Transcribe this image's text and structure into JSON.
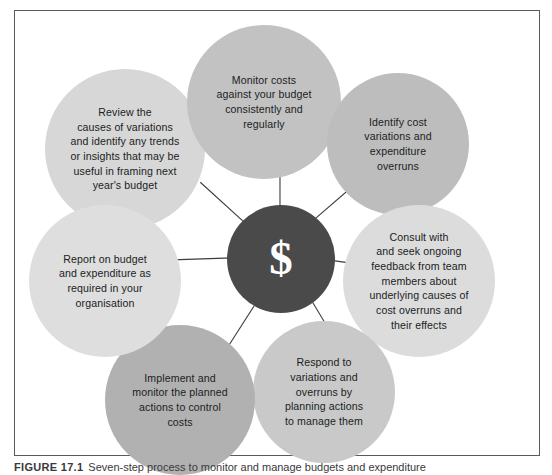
{
  "figure": {
    "caption_tag": "FIGURE 17.1",
    "caption_text": "Seven-step process to monitor and manage budgets and expenditure",
    "hub": {
      "symbol": "$",
      "name": "budget-and-expenditure-control",
      "fill": "#4a4a4a",
      "text_color": "#ffffff"
    },
    "frame": {
      "border_color": "#5a5a5a",
      "background": "#ffffff"
    },
    "connector_color": "#3c3c3c",
    "nodes": [
      {
        "id": "monitor-costs",
        "label": "Monitor costs\nagainst your budget\nconsistently and\nregularly",
        "fill": "#c2c2c2",
        "position": "top"
      },
      {
        "id": "identify-cost-variations",
        "label": "Identify cost\nvariations and\nexpenditure\noverruns",
        "fill": "#bdbdbd",
        "position": "upper-right"
      },
      {
        "id": "consult-and-seek-feedback",
        "label": "Consult with\nand seek ongoing\nfeedback from team\nmembers about\nunderlying causes of\ncost overruns and\ntheir effects",
        "fill": "#dcdcdc",
        "position": "lower-right"
      },
      {
        "id": "respond-to-variations",
        "label": "Respond to\nvariations and\noverruns by\nplanning actions\nto manage them",
        "fill": "#c9c9c9",
        "position": "bottom-right"
      },
      {
        "id": "implement-and-monitor-actions",
        "label": "Implement and\nmonitor the planned\nactions to control\ncosts",
        "fill": "#b1b1b1",
        "position": "bottom-left"
      },
      {
        "id": "report-on-budget",
        "label": "Report on budget\nand expenditure as\nrequired in your\norganisation",
        "fill": "#dedede",
        "position": "lower-left"
      },
      {
        "id": "review-causes-of-variations",
        "label": "Review the\ncauses of variations\nand identify any trends\nor insights that may be\nuseful in framing next\nyear's budget",
        "fill": "#d7d7d7",
        "position": "upper-left"
      }
    ]
  }
}
